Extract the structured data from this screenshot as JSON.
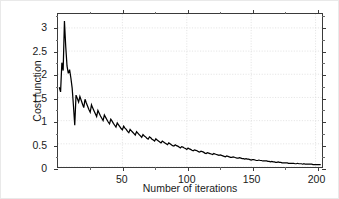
{
  "chart_data": {
    "type": "line",
    "title": "",
    "xlabel": "Number of iterations",
    "ylabel": "Cost function",
    "xlim": [
      0,
      205
    ],
    "ylim": [
      0,
      3.3
    ],
    "xticks": [
      50,
      100,
      150,
      200
    ],
    "xtick_labels": [
      "50",
      "100",
      "150",
      "200"
    ],
    "yticks": [
      0,
      0.5,
      1,
      1.5,
      2,
      2.5,
      3
    ],
    "ytick_labels": [
      "0",
      "0.5",
      "1",
      "1.5",
      "2",
      "2.5",
      "3"
    ],
    "grid": true,
    "legend": null,
    "line_color": "#000000",
    "series": [
      {
        "name": "Cost function",
        "x": [
          1,
          2,
          3,
          4,
          5,
          6,
          7,
          8,
          9,
          10,
          11,
          12,
          13,
          14,
          15,
          16,
          17,
          18,
          19,
          20,
          21,
          22,
          23,
          24,
          25,
          26,
          27,
          28,
          29,
          30,
          31,
          32,
          33,
          34,
          35,
          36,
          37,
          38,
          39,
          40,
          41,
          42,
          43,
          44,
          45,
          46,
          47,
          48,
          49,
          50,
          51,
          52,
          53,
          54,
          55,
          56,
          57,
          58,
          59,
          60,
          61,
          62,
          63,
          64,
          65,
          66,
          67,
          68,
          69,
          70,
          71,
          72,
          73,
          74,
          75,
          76,
          77,
          78,
          79,
          80,
          81,
          82,
          83,
          84,
          85,
          86,
          87,
          88,
          89,
          90,
          91,
          92,
          93,
          94,
          95,
          96,
          97,
          98,
          99,
          100,
          101,
          102,
          103,
          104,
          105,
          106,
          107,
          108,
          109,
          110,
          111,
          112,
          113,
          114,
          115,
          116,
          117,
          118,
          119,
          120,
          121,
          122,
          123,
          124,
          125,
          126,
          127,
          128,
          129,
          130,
          131,
          132,
          133,
          134,
          135,
          136,
          137,
          138,
          139,
          140,
          141,
          142,
          143,
          144,
          145,
          146,
          147,
          148,
          149,
          150,
          151,
          152,
          153,
          154,
          155,
          156,
          157,
          158,
          159,
          160,
          161,
          162,
          163,
          164,
          165,
          166,
          167,
          168,
          169,
          170,
          171,
          172,
          173,
          174,
          175,
          176,
          177,
          178,
          179,
          180,
          181,
          182,
          183,
          184,
          185,
          186,
          187,
          188,
          189,
          190,
          191,
          192,
          193,
          194,
          195,
          196,
          197,
          198,
          199,
          200,
          201,
          202,
          203,
          204
        ],
        "values": [
          1.72,
          1.62,
          2.25,
          2.08,
          3.15,
          2.6,
          2.18,
          2.02,
          2.1,
          1.92,
          1.7,
          1.32,
          0.9,
          1.55,
          1.48,
          1.4,
          1.52,
          1.44,
          1.36,
          1.28,
          1.46,
          1.38,
          1.31,
          1.24,
          1.18,
          1.34,
          1.27,
          1.21,
          1.15,
          1.09,
          1.22,
          1.16,
          1.1,
          1.05,
          1.0,
          1.12,
          1.07,
          1.02,
          0.97,
          0.93,
          1.03,
          0.99,
          0.94,
          0.9,
          0.86,
          0.95,
          0.91,
          0.87,
          0.83,
          0.8,
          0.88,
          0.84,
          0.81,
          0.77,
          0.74,
          0.81,
          0.78,
          0.75,
          0.72,
          0.69,
          0.76,
          0.73,
          0.7,
          0.67,
          0.64,
          0.7,
          0.67,
          0.65,
          0.62,
          0.6,
          0.65,
          0.63,
          0.6,
          0.58,
          0.56,
          0.61,
          0.58,
          0.56,
          0.54,
          0.52,
          0.56,
          0.54,
          0.52,
          0.5,
          0.48,
          0.52,
          0.5,
          0.48,
          0.46,
          0.45,
          0.48,
          0.46,
          0.45,
          0.43,
          0.41,
          0.44,
          0.43,
          0.41,
          0.4,
          0.38,
          0.41,
          0.39,
          0.38,
          0.36,
          0.35,
          0.37,
          0.36,
          0.35,
          0.33,
          0.32,
          0.34,
          0.33,
          0.32,
          0.3,
          0.29,
          0.31,
          0.3,
          0.29,
          0.28,
          0.27,
          0.29,
          0.28,
          0.27,
          0.26,
          0.25,
          0.26,
          0.25,
          0.24,
          0.23,
          0.22,
          0.24,
          0.23,
          0.22,
          0.21,
          0.21,
          0.22,
          0.21,
          0.2,
          0.19,
          0.19,
          0.2,
          0.19,
          0.18,
          0.18,
          0.17,
          0.18,
          0.17,
          0.17,
          0.16,
          0.15,
          0.16,
          0.16,
          0.15,
          0.14,
          0.14,
          0.15,
          0.14,
          0.14,
          0.13,
          0.13,
          0.13,
          0.13,
          0.12,
          0.12,
          0.11,
          0.12,
          0.11,
          0.11,
          0.1,
          0.1,
          0.11,
          0.1,
          0.1,
          0.09,
          0.09,
          0.09,
          0.09,
          0.09,
          0.08,
          0.08,
          0.08,
          0.08,
          0.08,
          0.07,
          0.07,
          0.08,
          0.07,
          0.07,
          0.07,
          0.06,
          0.07,
          0.06,
          0.06,
          0.06,
          0.06,
          0.06,
          0.06,
          0.05,
          0.05,
          0.05,
          0.05,
          0.05,
          0.05,
          0.05
        ]
      }
    ]
  }
}
